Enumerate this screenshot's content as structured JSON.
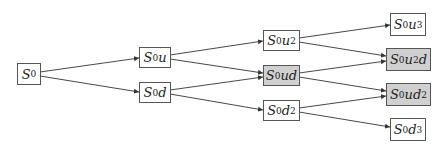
{
  "diagram": {
    "type": "binomial-tree",
    "highlight_color": "#d0d0d0",
    "nodes": [
      {
        "id": "s0",
        "base": "S",
        "sub": "0",
        "var": "",
        "sup": "",
        "tail": "",
        "label": "S0",
        "highlighted": false
      },
      {
        "id": "s0u",
        "base": "S",
        "sub": "0",
        "var": "u",
        "sup": "",
        "tail": "",
        "label": "S0u",
        "highlighted": false
      },
      {
        "id": "s0d",
        "base": "S",
        "sub": "0",
        "var": "d",
        "sup": "",
        "tail": "",
        "label": "S0d",
        "highlighted": false
      },
      {
        "id": "s0u2",
        "base": "S",
        "sub": "0",
        "var": "u",
        "sup": "2",
        "tail": "",
        "label": "S0u^2",
        "highlighted": false
      },
      {
        "id": "s0ud",
        "base": "S",
        "sub": "0",
        "var": "ud",
        "sup": "",
        "tail": "",
        "label": "S0ud",
        "highlighted": true
      },
      {
        "id": "s0d2",
        "base": "S",
        "sub": "0",
        "var": "d",
        "sup": "2",
        "tail": "",
        "label": "S0d^2",
        "highlighted": false
      },
      {
        "id": "s0u3",
        "base": "S",
        "sub": "0",
        "var": "u",
        "sup": "3",
        "tail": "",
        "label": "S0u^3",
        "highlighted": false
      },
      {
        "id": "s0u2d",
        "base": "S",
        "sub": "0",
        "var": "u",
        "sup": "2",
        "tail": "d",
        "label": "S0u^2d",
        "highlighted": true
      },
      {
        "id": "s0ud2",
        "base": "S",
        "sub": "0",
        "var": "ud",
        "sup": "2",
        "tail": "",
        "label": "S0ud^2",
        "highlighted": true
      },
      {
        "id": "s0d3",
        "base": "S",
        "sub": "0",
        "var": "d",
        "sup": "3",
        "tail": "",
        "label": "S0d^3",
        "highlighted": false
      }
    ],
    "edges": [
      {
        "from": "s0",
        "to": "s0u"
      },
      {
        "from": "s0",
        "to": "s0d"
      },
      {
        "from": "s0u",
        "to": "s0u2"
      },
      {
        "from": "s0u",
        "to": "s0ud"
      },
      {
        "from": "s0d",
        "to": "s0ud"
      },
      {
        "from": "s0d",
        "to": "s0d2"
      },
      {
        "from": "s0u2",
        "to": "s0u3"
      },
      {
        "from": "s0u2",
        "to": "s0u2d"
      },
      {
        "from": "s0ud",
        "to": "s0u2d"
      },
      {
        "from": "s0ud",
        "to": "s0ud2"
      },
      {
        "from": "s0d2",
        "to": "s0ud2"
      },
      {
        "from": "s0d2",
        "to": "s0d3"
      }
    ]
  }
}
